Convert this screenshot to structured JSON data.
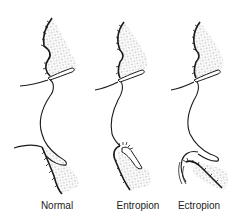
{
  "figure": {
    "panels": [
      {
        "id": "normal",
        "label": "Normal"
      },
      {
        "id": "entropion",
        "label": "Entropion"
      },
      {
        "id": "ectropion",
        "label": "Ectropion"
      }
    ]
  },
  "colors": {
    "line": "#1a1a1a",
    "stipple": "#555555",
    "background": "#ffffff",
    "label": "#222222"
  }
}
